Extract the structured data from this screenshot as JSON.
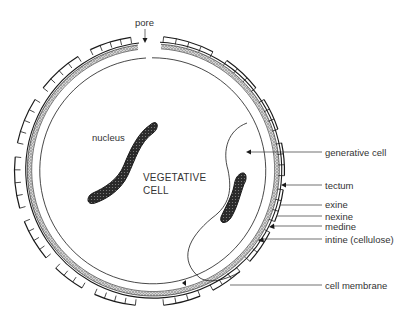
{
  "diagram": {
    "labels": {
      "pore": "pore",
      "nucleus": "nucleus",
      "vegetative_line1": "VEGETATIVE",
      "vegetative_line2": "CELL",
      "generative_cell": "generative cell",
      "tectum": "tectum",
      "exine": "exine",
      "nexine": "nexine",
      "medine": "medine",
      "intine": "intine (cellulose)",
      "cell_membrane": "cell membrane"
    },
    "colors": {
      "ink": "#1a1a1a",
      "stipple": "#9a9a9a",
      "text": "#333333",
      "background": "#ffffff"
    }
  }
}
